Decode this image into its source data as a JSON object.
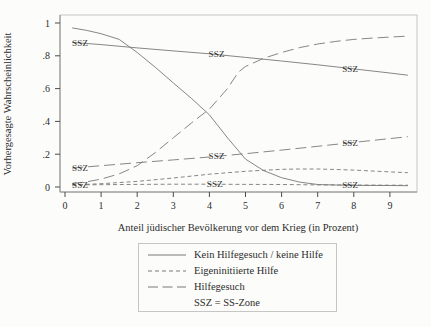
{
  "figure": {
    "background": "#fcfcfa",
    "line_color": "#787878",
    "frame_color": "#c6c6c4",
    "tick_color": "#4a4a4a",
    "text_color": "#2c2c2c"
  },
  "axes": {
    "x_label": "Anteil jüdischer Bevölkerung vor dem Krieg (in Prozent)",
    "y_label": "Vorhergesagte Wahrscheinlichkeit"
  },
  "legend": {
    "items": [
      {
        "label": "Kein Hilfegesuch / keine Hilfe",
        "dash": "solid"
      },
      {
        "label": "Eigeninitiierte Hilfe",
        "dash": "short"
      },
      {
        "label": "Hilfegesuch",
        "dash": "long"
      },
      {
        "label": "SSZ = SS-Zone",
        "dash": "none"
      }
    ]
  },
  "chart_data": {
    "type": "line",
    "title": "",
    "xlabel": "Anteil jüdischer Bevölkerung vor dem Krieg (in Prozent)",
    "ylabel": "Vorhergesagte Wahrscheinlichkeit",
    "xlim": [
      -0.15,
      9.75
    ],
    "ylim": [
      -0.03,
      1.08
    ],
    "grid": false,
    "legend_position": "below",
    "x_ticks": [
      {
        "v": 0,
        "label": "0"
      },
      {
        "v": 1,
        "label": "1"
      },
      {
        "v": 2,
        "label": "2"
      },
      {
        "v": 3,
        "label": "3"
      },
      {
        "v": 4,
        "label": "4"
      },
      {
        "v": 5,
        "label": "5"
      },
      {
        "v": 6,
        "label": "6"
      },
      {
        "v": 7,
        "label": "7"
      },
      {
        "v": 8,
        "label": "8"
      },
      {
        "v": 9,
        "label": "9"
      }
    ],
    "y_ticks": [
      {
        "v": 0,
        "label": "0"
      },
      {
        "v": 0.2,
        "label": ".2"
      },
      {
        "v": 0.4,
        "label": ".4"
      },
      {
        "v": 0.6,
        "label": ".6"
      },
      {
        "v": 0.8,
        "label": ".8"
      },
      {
        "v": 1,
        "label": "1"
      }
    ],
    "series": [
      {
        "name": "Kein Hilfegesuch / keine Hilfe",
        "zone": "non-SSZ",
        "dash": "solid",
        "points": [
          [
            0.2,
            0.97
          ],
          [
            0.6,
            0.955
          ],
          [
            1,
            0.935
          ],
          [
            1.5,
            0.9
          ],
          [
            2,
            0.82
          ],
          [
            2.5,
            0.73
          ],
          [
            3,
            0.635
          ],
          [
            3.5,
            0.54
          ],
          [
            4,
            0.44
          ],
          [
            4.5,
            0.3
          ],
          [
            5,
            0.17
          ],
          [
            5.5,
            0.1
          ],
          [
            6,
            0.057
          ],
          [
            6.5,
            0.03
          ],
          [
            7,
            0.015
          ],
          [
            7.5,
            0.012
          ],
          [
            8,
            0.01
          ],
          [
            9,
            0.009
          ],
          [
            9.5,
            0.008
          ]
        ]
      },
      {
        "name": "Kein Hilfegesuch / keine Hilfe",
        "zone": "SSZ",
        "dash": "solid",
        "points": [
          [
            0.2,
            0.882
          ],
          [
            1,
            0.868
          ],
          [
            2,
            0.848
          ],
          [
            3,
            0.83
          ],
          [
            4,
            0.812
          ],
          [
            5,
            0.79
          ],
          [
            6,
            0.768
          ],
          [
            7,
            0.745
          ],
          [
            8,
            0.72
          ],
          [
            9,
            0.695
          ],
          [
            9.5,
            0.682
          ]
        ]
      },
      {
        "name": "Hilfegesuch",
        "zone": "non-SSZ",
        "dash": "long",
        "points": [
          [
            0.2,
            0.02
          ],
          [
            0.6,
            0.032
          ],
          [
            1,
            0.048
          ],
          [
            1.5,
            0.08
          ],
          [
            2,
            0.13
          ],
          [
            2.5,
            0.21
          ],
          [
            3,
            0.3
          ],
          [
            3.5,
            0.39
          ],
          [
            4,
            0.475
          ],
          [
            4.5,
            0.6
          ],
          [
            4.8,
            0.7
          ],
          [
            5,
            0.735
          ],
          [
            5.5,
            0.785
          ],
          [
            6,
            0.82
          ],
          [
            6.5,
            0.85
          ],
          [
            7,
            0.872
          ],
          [
            7.5,
            0.888
          ],
          [
            8,
            0.9
          ],
          [
            8.5,
            0.908
          ],
          [
            9,
            0.914
          ],
          [
            9.5,
            0.92
          ]
        ]
      },
      {
        "name": "Hilfegesuch",
        "zone": "SSZ",
        "dash": "long",
        "points": [
          [
            0.2,
            0.115
          ],
          [
            1,
            0.13
          ],
          [
            2,
            0.148
          ],
          [
            3,
            0.165
          ],
          [
            4,
            0.183
          ],
          [
            5,
            0.203
          ],
          [
            6,
            0.225
          ],
          [
            7,
            0.248
          ],
          [
            8,
            0.272
          ],
          [
            9,
            0.295
          ],
          [
            9.5,
            0.307
          ]
        ]
      },
      {
        "name": "Eigeninitiierte Hilfe",
        "zone": "non-SSZ",
        "dash": "short",
        "points": [
          [
            0.2,
            0.012
          ],
          [
            1,
            0.02
          ],
          [
            2,
            0.034
          ],
          [
            3,
            0.055
          ],
          [
            4,
            0.078
          ],
          [
            5,
            0.096
          ],
          [
            6,
            0.108
          ],
          [
            6.5,
            0.11
          ],
          [
            7,
            0.11
          ],
          [
            7.5,
            0.107
          ],
          [
            8,
            0.103
          ],
          [
            9,
            0.092
          ],
          [
            9.5,
            0.087
          ]
        ]
      },
      {
        "name": "Eigeninitiierte Hilfe",
        "zone": "SSZ",
        "dash": "short",
        "points": [
          [
            0.2,
            0.013
          ],
          [
            1,
            0.014
          ],
          [
            2,
            0.016
          ],
          [
            3,
            0.017
          ],
          [
            4,
            0.017
          ],
          [
            5,
            0.016
          ],
          [
            6,
            0.015
          ],
          [
            7,
            0.013
          ],
          [
            8,
            0.012
          ],
          [
            9,
            0.011
          ],
          [
            9.5,
            0.011
          ]
        ]
      }
    ],
    "annotations": [
      {
        "text": "SSZ",
        "x": 0.42,
        "y": 0.878,
        "on": "Kein Hilfegesuch / keine Hilfe SSZ"
      },
      {
        "text": "SSZ",
        "x": 4.2,
        "y": 0.808,
        "on": "Kein Hilfegesuch / keine Hilfe SSZ"
      },
      {
        "text": "SSZ",
        "x": 7.9,
        "y": 0.722,
        "on": "Kein Hilfegesuch / keine Hilfe SSZ"
      },
      {
        "text": "SSZ",
        "x": 0.42,
        "y": 0.118,
        "on": "Hilfegesuch SSZ"
      },
      {
        "text": "SSZ",
        "x": 4.2,
        "y": 0.186,
        "on": "Hilfegesuch SSZ"
      },
      {
        "text": "SSZ",
        "x": 7.9,
        "y": 0.27,
        "on": "Hilfegesuch SSZ"
      },
      {
        "text": "SSZ",
        "x": 0.42,
        "y": 0.013,
        "on": "Eigeninitiierte Hilfe SSZ"
      },
      {
        "text": "SSZ",
        "x": 4.15,
        "y": 0.016,
        "on": "Eigeninitiierte Hilfe SSZ"
      },
      {
        "text": "SSZ",
        "x": 7.9,
        "y": 0.012,
        "on": "Eigeninitiierte Hilfe SSZ"
      }
    ]
  }
}
